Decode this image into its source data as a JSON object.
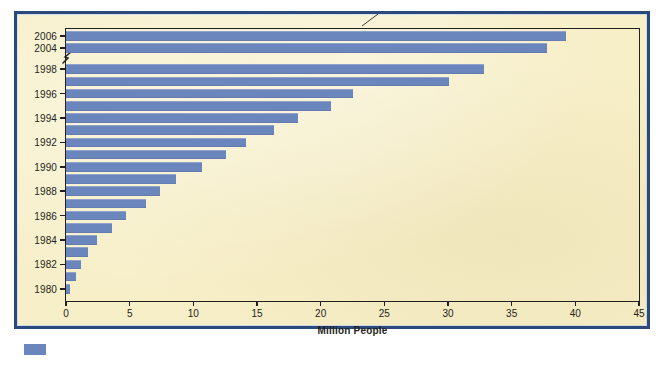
{
  "figure": {
    "axis_title_x": "Million People",
    "background_color": "#f7efc8",
    "frame_color": "#2a4a7c",
    "bar_color": "#6b85bd",
    "axis_color": "#231f20",
    "axis_break_note": "y-axis break between 1998 and 2004",
    "legend_swatch_color": "#6b85bd"
  },
  "chart_data": {
    "type": "bar",
    "orientation": "horizontal",
    "title": "",
    "subtitle": "",
    "xlabel": "Million People",
    "ylabel": "",
    "xlim": [
      0,
      45
    ],
    "xticks": [
      0,
      5,
      10,
      15,
      20,
      25,
      30,
      35,
      40,
      45
    ],
    "xtick_labels": [
      "0",
      "5",
      "10",
      "15",
      "20",
      "25",
      "30",
      "35",
      "40",
      "45"
    ],
    "grid": false,
    "legend": [],
    "legend_position": "none",
    "annotations": [
      "axis break between 1998 and 2004"
    ],
    "categories": [
      "2006",
      "2004",
      "1998",
      "1997",
      "1996",
      "1995",
      "1994",
      "1993",
      "1992",
      "1991",
      "1990",
      "1989",
      "1988",
      "1987",
      "1986",
      "1985",
      "1984",
      "1983",
      "1982",
      "1981",
      "1980"
    ],
    "values": [
      39.3,
      37.8,
      32.8,
      30.1,
      22.5,
      20.8,
      18.2,
      16.3,
      14.1,
      12.6,
      10.7,
      8.6,
      7.4,
      6.3,
      4.7,
      3.6,
      2.4,
      1.7,
      1.2,
      0.8,
      0.3
    ],
    "visible_ytick_labels": [
      "2006",
      "2004",
      "1998",
      "1996",
      "1994",
      "1992",
      "1990",
      "1988",
      "1986",
      "1984",
      "1982",
      "1980"
    ]
  }
}
